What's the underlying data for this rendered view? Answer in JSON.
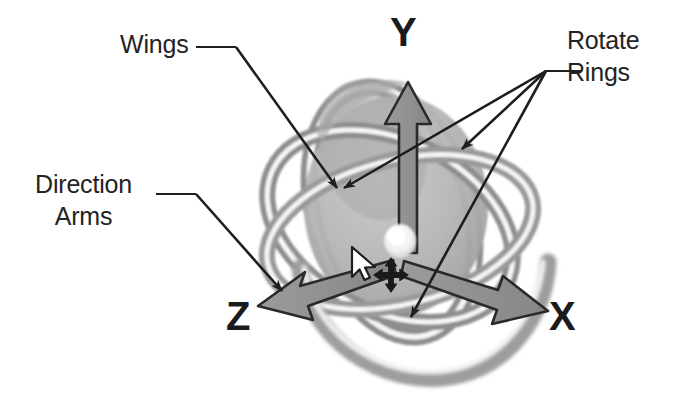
{
  "figure": {
    "kind": "annotated-diagram",
    "background_color": "#ffffff"
  },
  "callouts": [
    {
      "id": "wings",
      "label": "Wings",
      "points_to": "ring-wing-surface"
    },
    {
      "id": "rotate_rings",
      "label": "Rotate\nRings",
      "points_to": "three-rotation-rings"
    },
    {
      "id": "direction_arms",
      "label": "Direction\nArms",
      "points_to": "z-axis-arrow-head"
    }
  ],
  "axes": [
    {
      "id": "y",
      "label": "Y",
      "direction": "up"
    },
    {
      "id": "z",
      "label": "Z",
      "direction": "down-left"
    },
    {
      "id": "x",
      "label": "X",
      "direction": "down-right"
    }
  ],
  "gizmo": {
    "center_handle": "white-center-blob",
    "move_icon": "four-way-move-icon",
    "mouse_cursor": "arrow-cursor",
    "ring_count": 3
  },
  "colors": {
    "ink": "#232323",
    "axis_text": "#1b1b1b",
    "ring_dark": "#8e8e8e",
    "ring_mid": "#a5a5a5",
    "ring_light": "#bdbdbd",
    "wing_fill": "#b0b0b0",
    "arm_fill": "#8f8f8f",
    "arm_stroke": "#2a2a2a",
    "highlight": "#f4f4f4",
    "leader_line": "#1e1e1e"
  }
}
